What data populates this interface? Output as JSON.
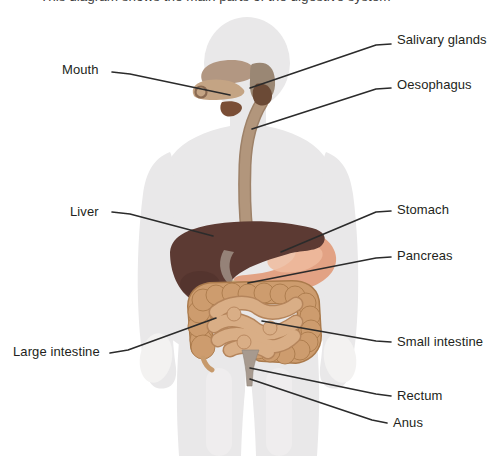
{
  "cropped_heading_fragment": "This diagram shows the main parts of the digestive system",
  "labels": {
    "mouth": "Mouth",
    "salivary_glands": "Salivary glands",
    "oesophagus": "Oesophagus",
    "liver": "Liver",
    "stomach": "Stomach",
    "pancreas": "Pancreas",
    "large_intestine": "Large intestine",
    "small_intestine": "Small intestine",
    "rectum": "Rectum",
    "anus": "Anus"
  },
  "colors": {
    "background": "#ffffff",
    "silhouette": "#e9e8e9",
    "hands": "#f3f2f1",
    "leader_line": "#2b2b2b",
    "label_text": "#231f20",
    "mouth_palate": "#b29782",
    "tongue": "#c4a484",
    "parotid_gland": "#9a8774",
    "salivary_gland_dark": "#6b4a36",
    "sublingual_wedge": "#7a4e36",
    "oesophagus": "#b2967c",
    "oesophagus_edge": "#9d8168",
    "liver": "#5c3a33",
    "liver_shade": "#4e2f29",
    "gallbladder": "#9b8b80",
    "stomach": "#e2a284",
    "stomach_highlight": "#eebb9e",
    "pancreas": "#e6d0a8",
    "large_intestine": "#cd9c6e",
    "large_intestine_edge": "#aa7a4c",
    "small_intestine": "#d9ae86",
    "small_intestine_edge": "#b5855c",
    "rectum": "#a79a8f"
  }
}
